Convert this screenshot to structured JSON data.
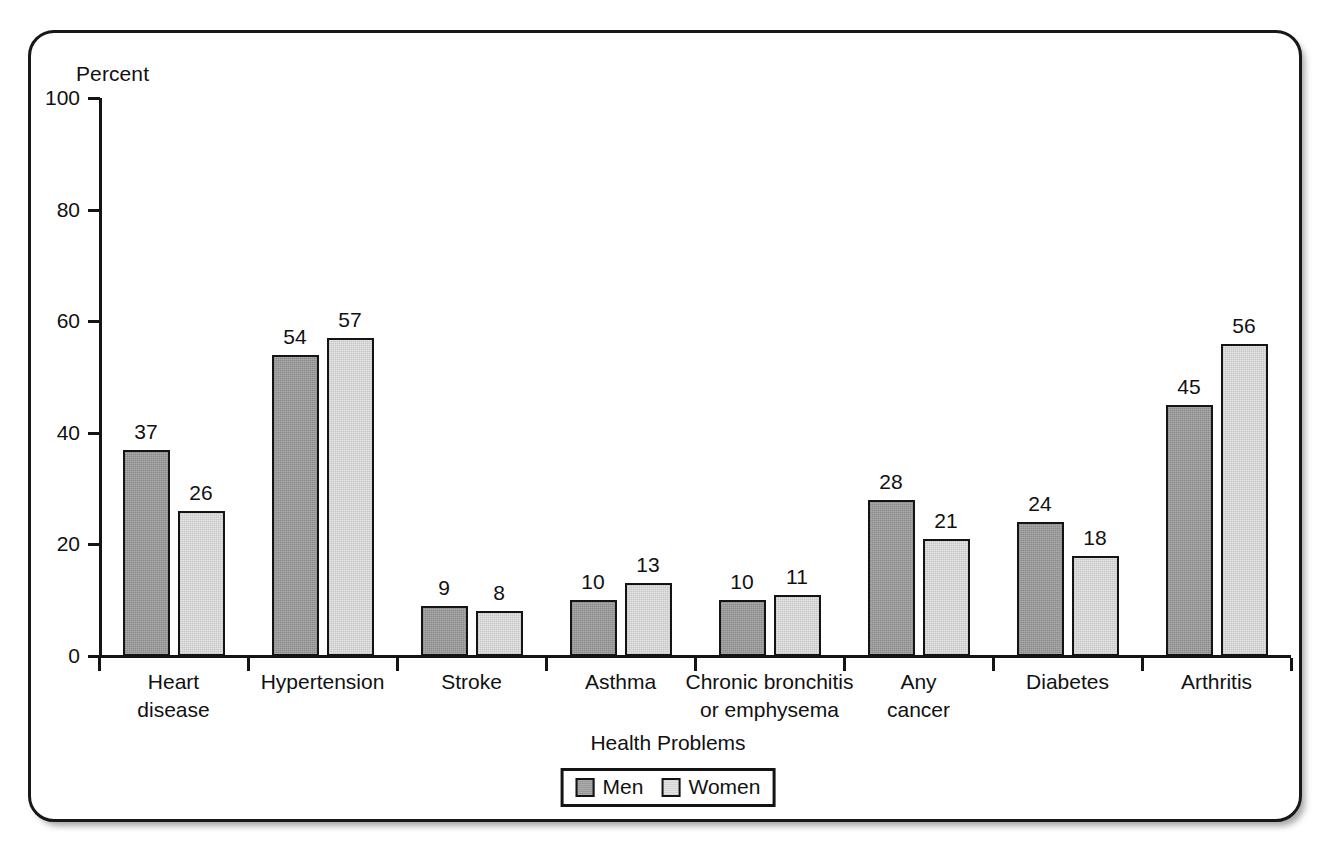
{
  "chart_data": {
    "type": "bar",
    "title": "",
    "xlabel": "Health Problems",
    "ylabel": "Percent",
    "ylim": [
      0,
      100
    ],
    "yticks": [
      0,
      20,
      40,
      60,
      80,
      100
    ],
    "grid": false,
    "legend_position": "bottom-center",
    "categories": [
      "Heart disease",
      "Hypertension",
      "Stroke",
      "Asthma",
      "Chronic bronchitis or emphysema",
      "Any cancer",
      "Diabetes",
      "Arthritis"
    ],
    "category_lines": [
      [
        "Heart",
        "disease"
      ],
      [
        "Hypertension"
      ],
      [
        "Stroke"
      ],
      [
        "Asthma"
      ],
      [
        "Chronic bronchitis",
        "or emphysema"
      ],
      [
        "Any",
        "cancer"
      ],
      [
        "Diabetes"
      ],
      [
        "Arthritis"
      ]
    ],
    "series": [
      {
        "name": "Men",
        "values": [
          37,
          54,
          9,
          10,
          10,
          28,
          24,
          45
        ]
      },
      {
        "name": "Women",
        "values": [
          26,
          57,
          8,
          13,
          11,
          21,
          18,
          56
        ]
      }
    ]
  },
  "legend": {
    "items": [
      {
        "label": "Men",
        "swatch": "men-swatch"
      },
      {
        "label": "Women",
        "swatch": "women-swatch"
      }
    ]
  },
  "colors": {
    "men": "#9a9a9a",
    "women": "#e4e4e4",
    "outline": "#141414",
    "text": "#111111",
    "background": "#ffffff"
  }
}
